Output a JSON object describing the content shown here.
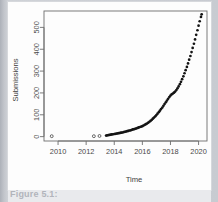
{
  "figure": {
    "caption_sliver": "Figure 5.1:",
    "background_color": "#fdfdfd",
    "page_color": "#c2c5cb"
  },
  "chart_data": {
    "type": "scatter",
    "title": "",
    "xlabel": "Time",
    "ylabel": "Submissions",
    "xlim": [
      2009.0,
      2020.6
    ],
    "ylim": [
      -20,
      575
    ],
    "xticks": [
      2010,
      2012,
      2014,
      2016,
      2018,
      2020
    ],
    "xtick_labels": [
      "2010",
      "2012",
      "2014",
      "2016",
      "2018",
      "2020"
    ],
    "yticks": [
      0,
      100,
      200,
      300,
      400,
      500
    ],
    "ytick_labels": [
      "0",
      "100",
      "200",
      "300",
      "400",
      "500"
    ],
    "grid": false,
    "legend": null,
    "point_color": "#141414",
    "series": [
      {
        "name": "Submissions",
        "marker": "open-circle",
        "x": [
          2009.55,
          2012.55,
          2012.95
        ],
        "values": [
          2,
          2,
          3
        ]
      },
      {
        "name": "Submissions (dense)",
        "marker": "filled-circle",
        "x": [
          2013.42,
          2013.5,
          2013.58,
          2013.67,
          2013.75,
          2013.83,
          2013.92,
          2014.0,
          2014.08,
          2014.17,
          2014.25,
          2014.33,
          2014.42,
          2014.5,
          2014.58,
          2014.67,
          2014.75,
          2014.83,
          2014.92,
          2015.0,
          2015.08,
          2015.17,
          2015.25,
          2015.33,
          2015.42,
          2015.5,
          2015.58,
          2015.67,
          2015.75,
          2015.83,
          2015.92,
          2016.0,
          2016.08,
          2016.17,
          2016.25,
          2016.33,
          2016.42,
          2016.5,
          2016.58,
          2016.67,
          2016.75,
          2016.83,
          2016.92,
          2017.0,
          2017.08,
          2017.17,
          2017.25,
          2017.33,
          2017.42,
          2017.5,
          2017.58,
          2017.67,
          2017.75,
          2017.83,
          2017.92,
          2018.0,
          2018.08,
          2018.17,
          2018.25,
          2018.33,
          2018.42,
          2018.5,
          2018.58,
          2018.67,
          2018.75,
          2018.83,
          2018.92,
          2019.0,
          2019.08,
          2019.17,
          2019.25,
          2019.33,
          2019.42,
          2019.5,
          2019.58,
          2019.67,
          2019.75,
          2019.83,
          2019.92,
          2020.0,
          2020.08,
          2020.17,
          2020.22
        ],
        "values": [
          5,
          6,
          7,
          8,
          9,
          10,
          11,
          12,
          13,
          14,
          15,
          16,
          17,
          18,
          19,
          21,
          22,
          23,
          25,
          26,
          28,
          29,
          31,
          33,
          34,
          36,
          38,
          40,
          42,
          44,
          46,
          48,
          51,
          54,
          57,
          60,
          64,
          68,
          72,
          77,
          82,
          87,
          93,
          99,
          105,
          112,
          119,
          126,
          133,
          141,
          149,
          157,
          165,
          173,
          181,
          188,
          193,
          197,
          201,
          206,
          213,
          221,
          230,
          240,
          251,
          263,
          276,
          290,
          304,
          319,
          335,
          352,
          369,
          387,
          406,
          425,
          445,
          466,
          487,
          508,
          528,
          548,
          560
        ]
      }
    ]
  }
}
